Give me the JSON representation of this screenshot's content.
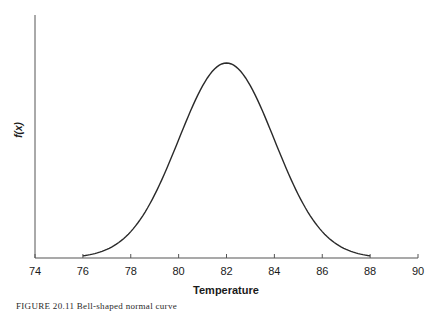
{
  "chart_data": {
    "type": "line",
    "title": "",
    "xlabel": "Temperature",
    "ylabel": "f(x)",
    "xlim": [
      74,
      90
    ],
    "xticks": [
      74,
      76,
      78,
      80,
      82,
      84,
      86,
      88,
      90
    ],
    "ylim": [
      0,
      0.2
    ],
    "grid": false,
    "legend": null,
    "series": [
      {
        "name": "Normal density (mean 82, sd 2)",
        "mean": 82,
        "sd": 2,
        "x": [
          76,
          77,
          78,
          79,
          80,
          81,
          82,
          83,
          84,
          85,
          86,
          87,
          88
        ],
        "y": [
          0.0022,
          0.0088,
          0.027,
          0.0648,
          0.121,
          0.176,
          0.1995,
          0.176,
          0.121,
          0.0648,
          0.027,
          0.0088,
          0.0022
        ]
      }
    ]
  },
  "axis": {
    "x_title": "Temperature",
    "y_title": "f(x)",
    "x_tick_labels": [
      "74",
      "76",
      "78",
      "80",
      "82",
      "84",
      "86",
      "88",
      "90"
    ]
  },
  "caption": "FIGURE 20.11  Bell-shaped normal curve"
}
